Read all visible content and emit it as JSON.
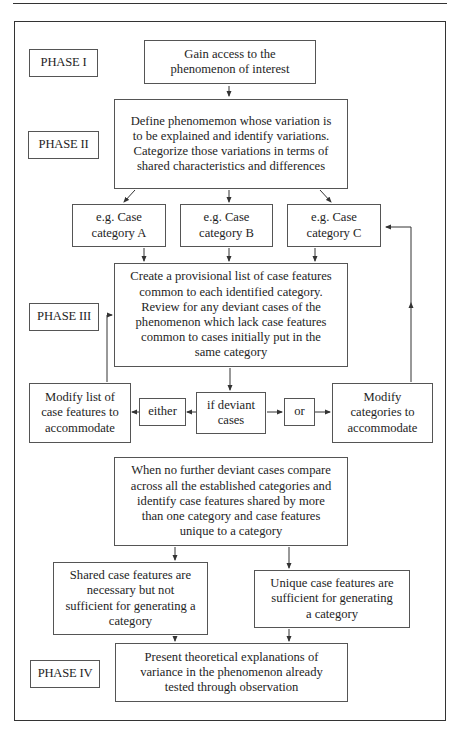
{
  "diagram": {
    "phases": {
      "phase1": "PHASE I",
      "phase2": "PHASE II",
      "phase3": "PHASE III",
      "phase4": "PHASE IV"
    },
    "nodes": {
      "gain_access": "Gain access to the phenomenon of interest",
      "define": "Define phenomemon whose variation is to be explained and identify variations. Categorize those variations in terms of shared characteristics and differences",
      "category_a": "e.g. Case category A",
      "category_b": "e.g. Case category B",
      "category_c": "e.g. Case category C",
      "create_list": "Create a provisional list of case features common to each identified category. Review for any deviant cases of the phenomenon which lack case features common to cases initially put in the same category",
      "modify_list": "Modify list of case features to accommodate",
      "either": "either",
      "if_deviant": "if deviant cases",
      "or": "or",
      "modify_categories": "Modify categories to accommodate",
      "no_further": "When no further deviant cases compare across all the established categories and identify case features shared by more than one category and case features unique to a category",
      "shared": "Shared case features are necessary but not sufficient for generating a category",
      "unique": "Unique case features are sufficient for generating a category",
      "present": "Present theoretical explanations of variance in the phenomenon already tested through observation"
    },
    "colors": {
      "line": "#333333",
      "box_border": "#555555",
      "text": "#1e1e1e",
      "background": "#ffffff"
    }
  }
}
